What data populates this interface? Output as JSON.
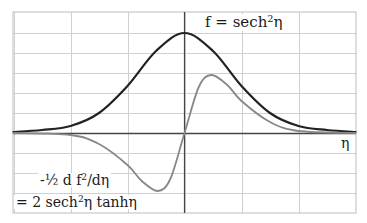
{
  "chart_data": {
    "type": "line",
    "title": "",
    "xlabel": "η",
    "ylabel": "",
    "grid": true,
    "legend": "inline annotations",
    "xlim_grid_units": [
      -3,
      3
    ],
    "ylim": [
      -1.0,
      1.0
    ],
    "x_grid_step": 1,
    "y_grid_step": 0.2,
    "annotations": {
      "f_label_main": "f = sech",
      "f_label_sup": "2",
      "f_label_tail": "η",
      "x_axis_label": "η",
      "deriv_line1_main": "-½ d f",
      "deriv_line1_sup": "2",
      "deriv_line1_tail": "/dη",
      "deriv_line2_main": "= 2 sech",
      "deriv_line2_sup": "2",
      "deriv_line2_tail": "η tanhη"
    },
    "series": [
      {
        "name": "f = sech²η",
        "color": "#222222",
        "stroke_width": 2.2,
        "x": [
          -3.0,
          -2.5,
          -2.0,
          -1.5,
          -1.0,
          -0.5,
          0.0,
          0.5,
          1.0,
          1.5,
          2.0,
          2.5,
          3.0
        ],
        "values": [
          0.01,
          0.03,
          0.07,
          0.2,
          0.47,
          0.82,
          1.0,
          0.82,
          0.47,
          0.2,
          0.07,
          0.03,
          0.01
        ]
      },
      {
        "name": "-½ d f²/dη = 2 sech²η tanhη",
        "color": "#888888",
        "stroke_width": 1.8,
        "x": [
          -3.0,
          -2.0,
          -1.5,
          -1.0,
          -0.75,
          -0.47,
          -0.25,
          0.0,
          0.25,
          0.47,
          0.75,
          1.0,
          1.5,
          2.0,
          3.0
        ],
        "values": [
          0.0,
          -0.02,
          -0.11,
          -0.32,
          -0.48,
          -0.58,
          -0.46,
          0.0,
          0.46,
          0.58,
          0.48,
          0.32,
          0.11,
          0.02,
          0.0
        ]
      }
    ]
  },
  "layout_colors": {
    "grid": "#d0d0d0",
    "axis": "#444444",
    "border": "#bdbdbd",
    "background": "#ffffff"
  }
}
